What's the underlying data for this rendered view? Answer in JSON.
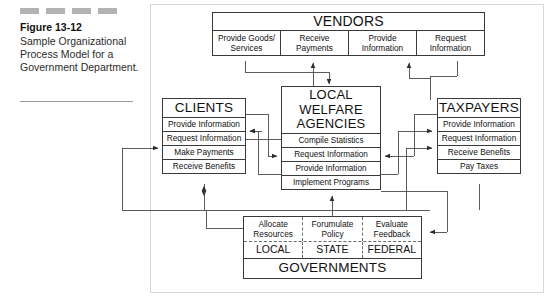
{
  "caption": {
    "figure_label": "Figure 13-12",
    "text": "Sample Organizational Process Model for a Government Department.",
    "dash_count": 4,
    "dash_color": "#b3b3b3"
  },
  "diagram": {
    "title": "Sample Organizational Process Model",
    "vendors": {
      "title": "VENDORS",
      "cells": [
        "Provide Goods/ Services",
        "Receive Payments",
        "Provide Information",
        "Request Information"
      ]
    },
    "clients": {
      "title": "CLIENTS",
      "rows": [
        "Provide Information",
        "Request Information",
        "Make Payments",
        "Receive Benefits"
      ]
    },
    "local_welfare_agencies": {
      "title": "LOCAL WELFARE AGENCIES",
      "rows": [
        "Compile Statistics",
        "Request Information",
        "Provide Information",
        "Implement Programs"
      ]
    },
    "taxpayers": {
      "title": "TAXPAYERS",
      "rows": [
        "Provide Information",
        "Request Information",
        "Receive Benefits",
        "Pay Taxes"
      ]
    },
    "governments": {
      "title": "GOVERNMENTS",
      "process_cells": [
        "Allocate Resources",
        "Forumulate Policy",
        "Evaluate Feedback"
      ],
      "level_cells": [
        "LOCAL",
        "STATE",
        "FEDERAL"
      ]
    },
    "colors": {
      "line": "#3a3a3a",
      "dashed_divider": "#6a6a6a",
      "text": "#111111",
      "background": "#ffffff"
    }
  }
}
